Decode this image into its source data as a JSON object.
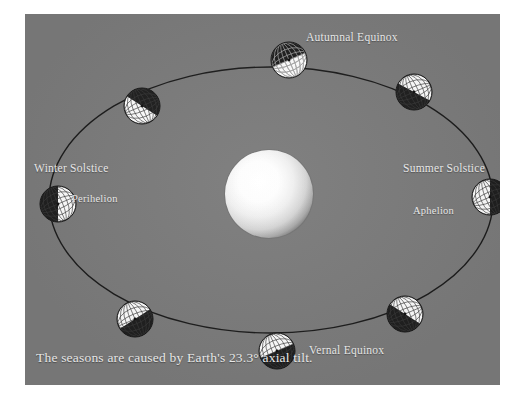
{
  "figure": {
    "caption": "The seasons are caused by Earth's 23.3° axial tilt.",
    "axial_tilt_degrees": "23.3°",
    "background_color": "#7c7c7c",
    "label_color": "#efefef",
    "orbit_stroke_color": "#1c1c1c",
    "sun_color": "#ffffff"
  },
  "labels": {
    "autumnal_equinox": "Autumnal Equinox",
    "vernal_equinox": "Vernal Equinox",
    "winter_solstice": "Winter Solstice",
    "summer_solstice": "Summer Solstice",
    "perihelion": "Perihelion",
    "aphelion": "Aphelion"
  },
  "sun": {
    "name": "Sun",
    "center_x": 244,
    "center_y": 180,
    "radius": 44
  },
  "orbit": {
    "center_x": 246,
    "center_y": 186,
    "radius_x": 222,
    "radius_y": 133,
    "stroke_width": 1.4
  },
  "earths": [
    {
      "id": "earth-autumnal-equinox",
      "position_label": "Autumnal Equinox",
      "x": 264,
      "y": 46,
      "radius": 18,
      "tilt_degrees": 23.3,
      "lit_half": "bottom",
      "dark_half": "top"
    },
    {
      "id": "earth-northwest",
      "position_label": "between Winter Solstice and Autumnal Equinox",
      "x": 117,
      "y": 92,
      "radius": 18,
      "tilt_degrees": 23.3,
      "lit_half": "lower-right",
      "dark_half": "upper-left"
    },
    {
      "id": "earth-winter-solstice",
      "position_label": "Winter Solstice",
      "x": 33,
      "y": 190,
      "radius": 18,
      "tilt_degrees": 23.3,
      "lit_half": "right",
      "dark_half": "left"
    },
    {
      "id": "earth-southwest",
      "position_label": "between Winter Solstice and Vernal Equinox",
      "x": 110,
      "y": 305,
      "radius": 18,
      "tilt_degrees": 23.3,
      "lit_half": "upper-right",
      "dark_half": "lower-left"
    },
    {
      "id": "earth-vernal-equinox",
      "position_label": "Vernal Equinox",
      "x": 252,
      "y": 337,
      "radius": 18,
      "tilt_degrees": 23.3,
      "lit_half": "top",
      "dark_half": "bottom"
    },
    {
      "id": "earth-southeast",
      "position_label": "between Vernal Equinox and Summer Solstice",
      "x": 380,
      "y": 300,
      "radius": 18,
      "tilt_degrees": 23.3,
      "lit_half": "upper-left",
      "dark_half": "lower-right"
    },
    {
      "id": "earth-summer-solstice",
      "position_label": "Summer Solstice",
      "x": 465,
      "y": 183,
      "radius": 18,
      "tilt_degrees": 23.3,
      "lit_half": "left",
      "dark_half": "right"
    },
    {
      "id": "earth-northeast",
      "position_label": "between Summer Solstice and Autumnal Equinox",
      "x": 389,
      "y": 78,
      "radius": 18,
      "tilt_degrees": 23.3,
      "lit_half": "upper-left",
      "dark_half": "lower-right"
    }
  ]
}
